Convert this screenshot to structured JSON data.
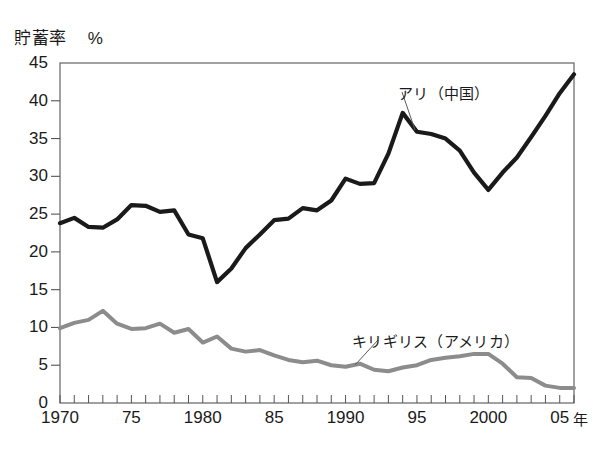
{
  "chart_data": {
    "type": "line",
    "title": "",
    "ylabel": "貯蓄率",
    "yunit": "%",
    "xlabel": "",
    "xunit": "年",
    "ylim": [
      0,
      45
    ],
    "xlim": [
      1970,
      2006
    ],
    "ytick_labels": [
      "45",
      "40",
      "35",
      "30",
      "25",
      "20",
      "15",
      "10",
      "5",
      "0"
    ],
    "ytick_values": [
      45,
      40,
      35,
      30,
      25,
      20,
      15,
      10,
      5,
      0
    ],
    "xtick_labels": [
      "1970",
      "75",
      "1980",
      "85",
      "1990",
      "95",
      "2000",
      "05"
    ],
    "xtick_values": [
      1970,
      1975,
      1980,
      1985,
      1990,
      1995,
      2000,
      2005
    ],
    "minor_xticks_every": 1,
    "grid": false,
    "legend_position": "inline-annotation",
    "x": [
      1970,
      1971,
      1972,
      1973,
      1974,
      1975,
      1976,
      1977,
      1978,
      1979,
      1980,
      1981,
      1982,
      1983,
      1984,
      1985,
      1986,
      1987,
      1988,
      1989,
      1990,
      1991,
      1992,
      1993,
      1994,
      1995,
      1996,
      1997,
      1998,
      1999,
      2000,
      2001,
      2002,
      2003,
      2004,
      2005,
      2006
    ],
    "series": [
      {
        "name": "アリ（中国）",
        "color": "#1a1a1a",
        "values": [
          23.8,
          24.5,
          23.3,
          23.2,
          24.3,
          26.2,
          26.1,
          25.3,
          25.5,
          22.3,
          21.8,
          16.0,
          17.8,
          20.5,
          22.3,
          24.2,
          24.4,
          25.8,
          25.5,
          26.8,
          29.7,
          29.0,
          29.1,
          33.0,
          38.4,
          35.9,
          35.6,
          35.0,
          33.4,
          30.5,
          28.2,
          30.5,
          32.5,
          35.2,
          38.0,
          41.0,
          43.5
        ]
      },
      {
        "name": "キリギリス（アメリカ）",
        "color": "#8c8c8c",
        "values": [
          9.9,
          10.6,
          11.0,
          12.2,
          10.5,
          9.8,
          9.9,
          10.5,
          9.3,
          9.8,
          8.0,
          8.8,
          7.2,
          6.8,
          7.0,
          6.3,
          5.7,
          5.4,
          5.6,
          5.0,
          4.8,
          5.2,
          4.4,
          4.2,
          4.7,
          5.0,
          5.7,
          6.0,
          6.2,
          6.5,
          6.5,
          5.2,
          3.4,
          3.3,
          2.3,
          2.0,
          2.0
        ]
      }
    ],
    "annotations": [
      {
        "text": "アリ（中国）",
        "label_x": 398,
        "label_y": 82,
        "leader_from_x": 402,
        "leader_from_y": 92,
        "leader_to_x": 415,
        "leader_to_y": 130
      },
      {
        "text": "キリギリス（アメリカ）",
        "label_x": 352,
        "label_y": 330,
        "leader_from_x": 378,
        "leader_from_y": 340,
        "leader_to_x": 355,
        "leader_to_y": 365
      }
    ],
    "plot_box": {
      "left": 60,
      "top": 63,
      "right": 574,
      "bottom": 403
    },
    "axis_color": "#555555",
    "background": "#ffffff"
  }
}
